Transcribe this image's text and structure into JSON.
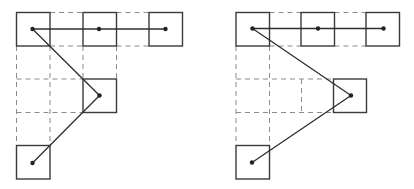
{
  "figure": {
    "width": 414,
    "height": 189,
    "colors": {
      "box_stroke": "#3a3a3a",
      "dashed_stroke": "#8a8a8a",
      "link_stroke": "#2e2e2e",
      "dot_fill": "#222222",
      "background": "#ffffff"
    },
    "cell_size": 33,
    "panels": [
      {
        "name": "left-panel",
        "boxes": [
          {
            "x": 16.5,
            "y": 12.5,
            "w": 33.5,
            "h": 33.5,
            "cx": 32.5,
            "cy": 29
          },
          {
            "x": 83,
            "y": 12.5,
            "w": 33.5,
            "h": 33.5,
            "cx": 99,
            "cy": 29
          },
          {
            "x": 149,
            "y": 12.5,
            "w": 33.5,
            "h": 33.5,
            "cx": 165.5,
            "cy": 29
          },
          {
            "x": 83,
            "y": 79,
            "w": 33.5,
            "h": 33.5,
            "cx": 99.5,
            "cy": 95.5
          },
          {
            "x": 16.5,
            "y": 145.5,
            "w": 33.5,
            "h": 33.5,
            "cx": 32.5,
            "cy": 163
          }
        ],
        "dashed_lines": [
          [
            50,
            12.5,
            83,
            12.5
          ],
          [
            116.5,
            12.5,
            149,
            12.5
          ],
          [
            50,
            46,
            83,
            46
          ],
          [
            116.5,
            46,
            149,
            46
          ],
          [
            16.5,
            46,
            16.5,
            145.5
          ],
          [
            50,
            46,
            50,
            145.5
          ],
          [
            83,
            46,
            83,
            79
          ],
          [
            116.5,
            46,
            116.5,
            79
          ],
          [
            16.5,
            79,
            83,
            79
          ],
          [
            16.5,
            112.5,
            83,
            112.5
          ]
        ],
        "links": [
          [
            32.5,
            29,
            165.5,
            29
          ],
          [
            32.5,
            29,
            99.5,
            95.5
          ],
          [
            99.5,
            95.5,
            32.5,
            163
          ]
        ]
      },
      {
        "name": "right-panel",
        "boxes": [
          {
            "x": 236,
            "y": 12.5,
            "w": 33.5,
            "h": 33.5,
            "cx": 252.5,
            "cy": 28.5
          },
          {
            "x": 301,
            "y": 12.5,
            "w": 33.5,
            "h": 33.5,
            "cx": 318,
            "cy": 28.5
          },
          {
            "x": 366,
            "y": 12.5,
            "w": 33.5,
            "h": 33.5,
            "cx": 383.5,
            "cy": 28.5
          },
          {
            "x": 333.5,
            "y": 79,
            "w": 33,
            "h": 33.5,
            "cx": 351,
            "cy": 95.5
          },
          {
            "x": 236,
            "y": 145.5,
            "w": 33.5,
            "h": 33.5,
            "cx": 252,
            "cy": 162.5
          }
        ],
        "dashed_lines": [
          [
            269.5,
            12.5,
            301,
            12.5
          ],
          [
            334.5,
            12.5,
            366,
            12.5
          ],
          [
            269.5,
            46,
            301,
            46
          ],
          [
            334.5,
            46,
            366,
            46
          ],
          [
            236,
            46,
            236,
            145.5
          ],
          [
            269.5,
            46,
            269.5,
            145.5
          ],
          [
            236,
            79,
            333.5,
            79
          ],
          [
            236,
            112.5,
            333.5,
            112.5
          ],
          [
            301.5,
            79,
            301.5,
            112.5
          ]
        ],
        "links": [
          [
            252.5,
            28.5,
            383.5,
            28.5
          ],
          [
            252.5,
            28.5,
            351,
            95.5
          ],
          [
            351,
            95.5,
            252,
            162.5
          ]
        ]
      }
    ]
  }
}
